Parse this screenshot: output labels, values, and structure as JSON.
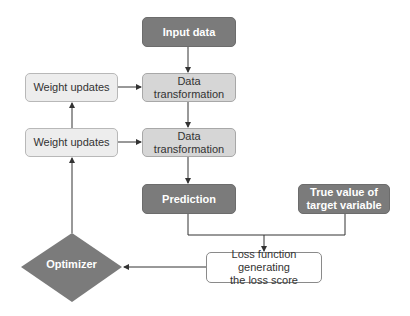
{
  "diagram": {
    "nodes": {
      "input_data": "Input data",
      "data_transformation_1": "Data transformation",
      "data_transformation_2": "Data transformation",
      "weight_updates_1": "Weight updates",
      "weight_updates_2": "Weight updates",
      "prediction": "Prediction",
      "true_value": "True value of target variable",
      "loss_function_line1": "Loss function generating",
      "loss_function_line2": "the loss score",
      "optimizer": "Optimizer"
    },
    "colors": {
      "dark_fill": "#7b7b7b",
      "mid_fill": "#d6d6d6",
      "light_fill": "#ededed",
      "line": "#333333"
    },
    "edges": [
      [
        "input_data",
        "data_transformation_1"
      ],
      [
        "weight_updates_1",
        "data_transformation_1"
      ],
      [
        "data_transformation_1",
        "data_transformation_2"
      ],
      [
        "weight_updates_2",
        "data_transformation_2"
      ],
      [
        "weight_updates_2",
        "weight_updates_1"
      ],
      [
        "data_transformation_2",
        "prediction"
      ],
      [
        "prediction",
        "loss_function"
      ],
      [
        "true_value",
        "loss_function"
      ],
      [
        "loss_function",
        "optimizer"
      ],
      [
        "optimizer",
        "weight_updates_2"
      ]
    ]
  }
}
